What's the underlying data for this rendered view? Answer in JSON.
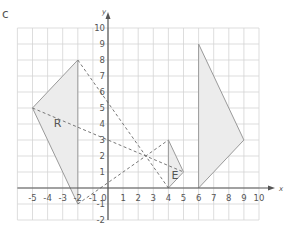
{
  "question_label": "c",
  "axes": {
    "x_label": "x",
    "y_label": "y",
    "x_ticks": [
      "-5",
      "-4",
      "-3",
      "-2",
      "-1",
      "0",
      "1",
      "2",
      "3",
      "4",
      "5",
      "6",
      "7",
      "8",
      "9",
      "10"
    ],
    "x_tick_values": [
      -5,
      -4,
      -3,
      -2,
      -1,
      0,
      1,
      2,
      3,
      4,
      5,
      6,
      7,
      8,
      9,
      10
    ],
    "y_ticks": [
      "-2",
      "-1",
      "1",
      "2",
      "3",
      "4",
      "5",
      "6",
      "7",
      "8",
      "9",
      "10"
    ],
    "y_tick_values": [
      -2,
      -1,
      1,
      2,
      3,
      4,
      5,
      6,
      7,
      8,
      9,
      10
    ],
    "xlim": [
      -6,
      10
    ],
    "ylim": [
      -2,
      10
    ]
  },
  "shapes": [
    {
      "name": "R",
      "label": "R",
      "vertices": [
        [
          -2,
          8
        ],
        [
          -5,
          5
        ],
        [
          -2,
          -1
        ]
      ],
      "label_pos": [
        -3.6,
        3.8
      ],
      "fill": "#ececec",
      "stroke": "#9a9a9a"
    },
    {
      "name": "E",
      "label": "E",
      "vertices": [
        [
          4,
          3
        ],
        [
          5,
          1
        ],
        [
          4,
          0
        ]
      ],
      "label_pos": [
        4.2,
        0.55
      ],
      "fill": "#ececec",
      "stroke": "#9a9a9a"
    },
    {
      "name": "image",
      "label": "",
      "vertices": [
        [
          6,
          9
        ],
        [
          9,
          3
        ],
        [
          6,
          0
        ]
      ],
      "fill": "#ececec",
      "stroke": "#9a9a9a"
    }
  ],
  "dashed_rays": [
    {
      "from": [
        -2,
        8
      ],
      "to": [
        4,
        0
      ]
    },
    {
      "from": [
        -5,
        5
      ],
      "to": [
        5,
        1
      ]
    },
    {
      "from": [
        -2,
        -1
      ],
      "to": [
        4,
        3
      ]
    }
  ],
  "colors": {
    "grid": "#d4d4d4",
    "axis": "#555555",
    "shape_fill": "#ececec",
    "shape_stroke": "#9a9a9a",
    "dash": "#777777",
    "text": "#555555"
  }
}
